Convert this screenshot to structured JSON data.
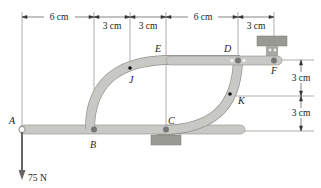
{
  "diagram": {
    "type": "mechanism frame",
    "points": [
      "A",
      "B",
      "C",
      "D",
      "E",
      "F",
      "J",
      "K"
    ],
    "labels": {
      "A": "A",
      "B": "B",
      "C": "C",
      "D": "D",
      "E": "E",
      "F": "F",
      "J": "J",
      "K": "K"
    },
    "top_dimensions": [
      "6 cm",
      "3 cm",
      "3 cm",
      "6 cm",
      "3 cm"
    ],
    "right_dimensions": [
      "3 cm",
      "3 cm"
    ],
    "load": {
      "label": "75 N",
      "point": "A",
      "direction": "down"
    },
    "colors": {
      "member_fill": "#c8c8c4",
      "member_edge": "#8e8e8a",
      "support": "#9a9a94",
      "line": "#555555"
    }
  }
}
